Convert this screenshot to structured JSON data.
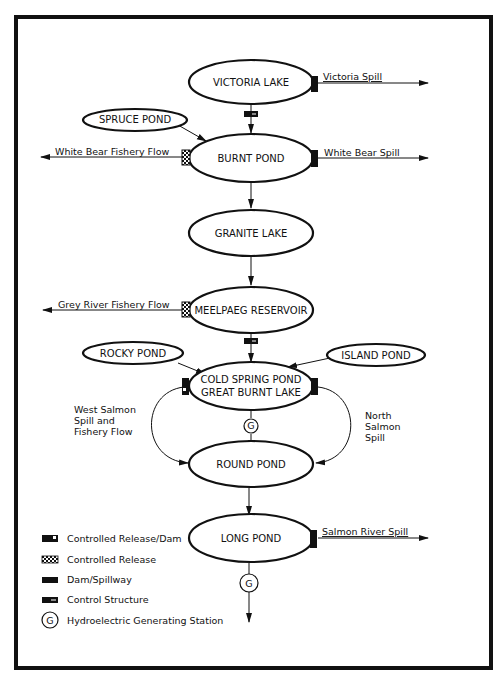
{
  "diagram": {
    "type": "water-flow schematic",
    "nodes": {
      "victoria_lake": "VICTORIA LAKE",
      "spruce_pond": "SPRUCE POND",
      "burnt_pond": "BURNT POND",
      "granite_lake": "GRANITE LAKE",
      "meelpaeg_reservoir": "MEELPAEG RESERVOIR",
      "rocky_pond": "ROCKY POND",
      "island_pond": "ISLAND POND",
      "cold_spring_line1": "COLD SPRING POND",
      "cold_spring_line2": "GREAT BURNT LAKE",
      "round_pond": "ROUND POND",
      "long_pond": "LONG POND"
    },
    "flows": {
      "victoria_spill": "Victoria Spill",
      "white_bear_fishery": "White Bear Fishery Flow",
      "white_bear_spill": "White Bear Spill",
      "grey_river_fishery": "Grey River Fishery Flow",
      "west_salmon_1": "West Salmon",
      "west_salmon_2": "Spill and",
      "west_salmon_3": "Fishery Flow",
      "north_salmon_1": "North",
      "north_salmon_2": "Salmon",
      "north_salmon_3": "Spill",
      "salmon_river_spill": "Salmon River Spill"
    },
    "generating_station_symbol": "G",
    "legend": [
      {
        "symbol": "controlled-release-dam",
        "label": "Controlled Release/Dam"
      },
      {
        "symbol": "controlled-release",
        "label": "Controlled Release"
      },
      {
        "symbol": "dam-spillway",
        "label": "Dam/Spillway"
      },
      {
        "symbol": "control-structure",
        "label": "Control Structure"
      },
      {
        "symbol": "G",
        "label": "Hydroelectric Generating Station"
      }
    ],
    "colors": {
      "ink": "#111111",
      "background": "#ffffff"
    }
  }
}
